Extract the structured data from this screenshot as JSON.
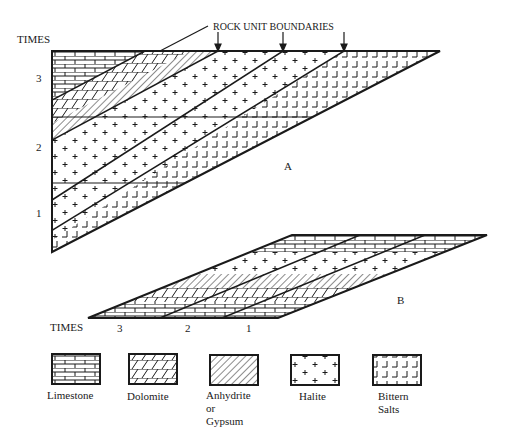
{
  "diagram_a": {
    "label": "A",
    "callout": "ROCK UNIT BOUNDARIES",
    "axis_title": "TIMES",
    "time_ticks": [
      "3",
      "2",
      "1"
    ]
  },
  "diagram_b": {
    "label": "B",
    "axis_title": "TIMES",
    "time_ticks": [
      "3",
      "2",
      "1"
    ]
  },
  "legend": {
    "items": [
      {
        "name": "limestone",
        "label": "Limestone"
      },
      {
        "name": "dolomite",
        "label": "Dolomite"
      },
      {
        "name": "anhydrite",
        "label": "Anhydrite\nor\nGypsum"
      },
      {
        "name": "halite",
        "label": "Halite"
      },
      {
        "name": "bittern",
        "label": "Bittern\nSalts"
      }
    ]
  },
  "colors": {
    "ink": "#1a1a1a",
    "paper": "#ffffff"
  }
}
